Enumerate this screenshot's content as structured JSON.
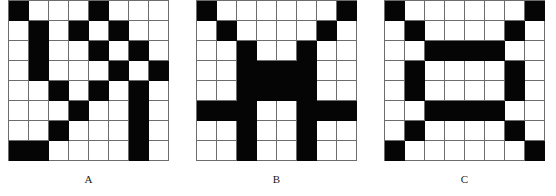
{
  "figure": {
    "type": "binary-grid-patterns",
    "grid_size": {
      "rows": 8,
      "cols": 8
    },
    "colors": {
      "filled": "#050505",
      "empty": "#ffffff",
      "gridline": "#6d6d6d",
      "caption": "#1a1a1a"
    },
    "panels": [
      {
        "id": "a",
        "label": "A",
        "cells": [
          [
            1,
            0,
            0,
            0,
            1,
            0,
            0,
            0
          ],
          [
            0,
            1,
            0,
            1,
            0,
            1,
            0,
            0
          ],
          [
            0,
            1,
            0,
            0,
            1,
            0,
            1,
            0
          ],
          [
            0,
            1,
            0,
            0,
            0,
            1,
            0,
            1
          ],
          [
            0,
            0,
            1,
            0,
            1,
            0,
            1,
            0
          ],
          [
            0,
            0,
            0,
            1,
            0,
            0,
            1,
            0
          ],
          [
            0,
            0,
            1,
            0,
            0,
            0,
            1,
            0
          ],
          [
            1,
            1,
            0,
            0,
            0,
            0,
            1,
            0
          ]
        ]
      },
      {
        "id": "b",
        "label": "B",
        "cells": [
          [
            1,
            0,
            0,
            0,
            0,
            0,
            0,
            1
          ],
          [
            0,
            1,
            0,
            0,
            0,
            0,
            1,
            0
          ],
          [
            0,
            0,
            1,
            0,
            0,
            1,
            0,
            0
          ],
          [
            0,
            0,
            1,
            1,
            1,
            1,
            0,
            0
          ],
          [
            0,
            0,
            1,
            1,
            1,
            1,
            0,
            0
          ],
          [
            1,
            1,
            1,
            0,
            0,
            1,
            1,
            1
          ],
          [
            0,
            0,
            1,
            0,
            0,
            1,
            0,
            0
          ],
          [
            0,
            0,
            1,
            0,
            0,
            1,
            0,
            0
          ]
        ]
      },
      {
        "id": "c",
        "label": "C",
        "cells": [
          [
            1,
            0,
            0,
            0,
            0,
            0,
            0,
            1
          ],
          [
            0,
            1,
            0,
            0,
            0,
            0,
            1,
            0
          ],
          [
            0,
            0,
            1,
            1,
            1,
            1,
            0,
            0
          ],
          [
            0,
            1,
            0,
            0,
            0,
            0,
            1,
            0
          ],
          [
            0,
            1,
            0,
            0,
            0,
            0,
            1,
            0
          ],
          [
            0,
            0,
            1,
            1,
            1,
            1,
            0,
            0
          ],
          [
            0,
            1,
            0,
            0,
            0,
            0,
            1,
            0
          ],
          [
            1,
            0,
            0,
            0,
            0,
            0,
            0,
            1
          ]
        ]
      }
    ]
  }
}
